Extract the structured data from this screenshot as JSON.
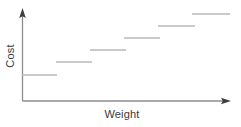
{
  "chart_data": {
    "type": "line",
    "title": "",
    "subtitle": "",
    "xlabel": "Weight",
    "ylabel": "Cost",
    "grid": false,
    "legend": null,
    "x_ticks": [],
    "y_ticks": [],
    "xlim": [
      0,
      10
    ],
    "ylim": [
      0,
      10
    ],
    "axis_style": "arrow-headed open axes, no tick marks",
    "step_color": "#b9b9b9",
    "axis_color": "#8c8c8c",
    "label_color": "#3a3a3a",
    "background_color": "#ffffff",
    "series": [
      {
        "name": "Cost",
        "style": "step",
        "segments": [
          {
            "index": 1,
            "x_start": 22,
            "x_end": 57,
            "y": 75,
            "value": 1
          },
          {
            "index": 2,
            "x_start": 56,
            "x_end": 92,
            "y": 62,
            "value": 2
          },
          {
            "index": 3,
            "x_start": 90,
            "x_end": 126,
            "y": 50,
            "value": 3
          },
          {
            "index": 4,
            "x_start": 124,
            "x_end": 160,
            "y": 38,
            "value": 4
          },
          {
            "index": 5,
            "x_start": 158,
            "x_end": 195,
            "y": 26,
            "value": 5
          },
          {
            "index": 6,
            "x_start": 192,
            "x_end": 230,
            "y": 14,
            "value": 6
          }
        ]
      }
    ]
  },
  "axes": {
    "y": {
      "label": "Cost",
      "origin_x": 22,
      "origin_y": 101,
      "top_y": 10
    },
    "x": {
      "label": "Weight",
      "origin_x": 22,
      "origin_y": 101,
      "right_x": 231
    }
  },
  "labels": {
    "y_axis_label": "Cost",
    "x_axis_label": "Weight"
  }
}
